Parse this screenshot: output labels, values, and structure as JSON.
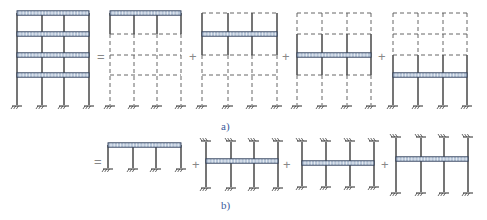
{
  "colors": {
    "line": "#2b2b2b",
    "dashed": "#555555",
    "beam_fill": "#b8c7da",
    "beam_stroke": "#2b3a55",
    "label": "#3a5a9a",
    "operator": "#888888"
  },
  "labels": {
    "a": "a)",
    "b": "b)"
  },
  "operators": [
    {
      "symbol": "=",
      "x": 97,
      "y": 50
    },
    {
      "symbol": "+",
      "x": 189,
      "y": 50
    },
    {
      "symbol": "+",
      "x": 282,
      "y": 50
    },
    {
      "symbol": "+",
      "x": 378,
      "y": 50
    },
    {
      "symbol": "=",
      "x": 94,
      "y": 155
    },
    {
      "symbol": "+",
      "x": 192,
      "y": 158
    },
    {
      "symbol": "+",
      "x": 283,
      "y": 158
    },
    {
      "symbol": "+",
      "x": 381,
      "y": 158
    }
  ],
  "row_a": {
    "caption": "Four-storey three-bay frame under floor loads decomposed into single-floor load cases",
    "floors_y": [
      13,
      34,
      55,
      75
    ],
    "base_y": 105,
    "frames": [
      {
        "name": "original-frame",
        "cols_x": [
          17,
          42,
          64,
          89
        ],
        "loaded_floor": "all",
        "solid_range": [
          13,
          105
        ]
      },
      {
        "name": "case-top-floor",
        "cols_x": [
          110,
          134,
          157,
          181
        ],
        "loaded_floor": 0,
        "solid_range": [
          13,
          34
        ]
      },
      {
        "name": "case-floor-3",
        "cols_x": [
          202,
          228,
          252,
          277
        ],
        "loaded_floor": 1,
        "solid_range": [
          13,
          55
        ]
      },
      {
        "name": "case-floor-2",
        "cols_x": [
          297,
          322,
          347,
          371
        ],
        "loaded_floor": 2,
        "solid_range": [
          34,
          75
        ]
      },
      {
        "name": "case-floor-1",
        "cols_x": [
          393,
          418,
          443,
          467
        ],
        "loaded_floor": 3,
        "solid_range": [
          55,
          105
        ]
      }
    ]
  },
  "row_b": {
    "caption": "Layer-method isolated sub-frames with fixed far ends",
    "frames": [
      {
        "name": "subframe-top",
        "cols_x": [
          108,
          133,
          156,
          181
        ],
        "beam_y": 145,
        "top_y": null,
        "bottom_y": 168
      },
      {
        "name": "subframe-floor-3",
        "cols_x": [
          206,
          231,
          254,
          278
        ],
        "beam_y": 161,
        "top_y": 142,
        "bottom_y": 187
      },
      {
        "name": "subframe-floor-2",
        "cols_x": [
          302,
          326,
          350,
          374
        ],
        "beam_y": 163,
        "top_y": 142,
        "bottom_y": 186
      },
      {
        "name": "subframe-floor-1",
        "cols_x": [
          396,
          421,
          444,
          468
        ],
        "beam_y": 159,
        "top_y": 138,
        "bottom_y": 192
      }
    ]
  }
}
